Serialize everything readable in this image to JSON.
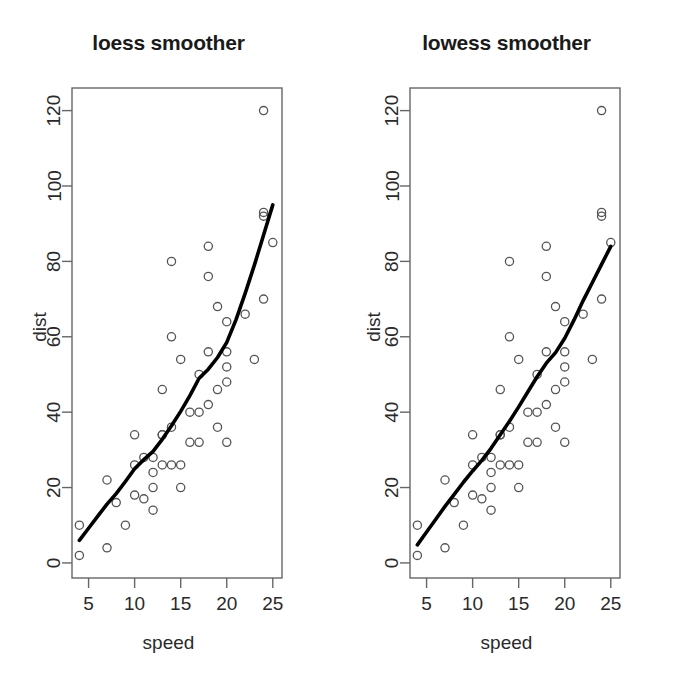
{
  "figure": {
    "background": "#ffffff",
    "point_color": "#555555",
    "line_color": "#000000",
    "axis_color": "#666666",
    "text_color": "#2a2a2a"
  },
  "panels": [
    {
      "id": "loess",
      "title": "loess smoother",
      "xlabel": "speed",
      "ylabel": "dist"
    },
    {
      "id": "lowess",
      "title": "lowess smoother",
      "xlabel": "speed",
      "ylabel": "dist"
    }
  ],
  "chart_data": [
    {
      "type": "scatter",
      "title": "loess smoother",
      "xlabel": "speed",
      "ylabel": "dist",
      "xlim": [
        3.2,
        26.0
      ],
      "ylim": [
        -4,
        126
      ],
      "xticks": [
        5,
        10,
        15,
        20,
        25
      ],
      "yticks": [
        0,
        20,
        40,
        60,
        80,
        100,
        120
      ],
      "grid": false,
      "legend": null,
      "x": [
        4,
        4,
        7,
        7,
        8,
        9,
        10,
        10,
        10,
        11,
        11,
        12,
        12,
        12,
        12,
        13,
        13,
        13,
        13,
        14,
        14,
        14,
        14,
        15,
        15,
        15,
        16,
        16,
        17,
        17,
        17,
        18,
        18,
        18,
        18,
        19,
        19,
        19,
        20,
        20,
        20,
        20,
        20,
        22,
        23,
        24,
        24,
        24,
        24,
        25
      ],
      "y": [
        2,
        10,
        4,
        22,
        16,
        10,
        18,
        26,
        34,
        17,
        28,
        14,
        20,
        24,
        28,
        26,
        34,
        34,
        46,
        26,
        36,
        60,
        80,
        20,
        26,
        54,
        32,
        40,
        32,
        40,
        50,
        42,
        56,
        76,
        84,
        36,
        46,
        68,
        32,
        48,
        52,
        56,
        64,
        66,
        54,
        70,
        92,
        93,
        120,
        85
      ],
      "series": [
        {
          "name": "loess smoother",
          "type": "line",
          "x": [
            4.0,
            5.0,
            6.0,
            7.0,
            8.0,
            9.0,
            10.0,
            11.0,
            12.0,
            13.0,
            14.0,
            15.0,
            16.0,
            17.0,
            18.0,
            19.0,
            20.0,
            21.0,
            22.0,
            23.0,
            24.0,
            25.0
          ],
          "y": [
            6.0,
            9.2,
            12.4,
            15.6,
            18.4,
            21.6,
            25.0,
            27.4,
            29.6,
            32.8,
            36.4,
            40.2,
            44.4,
            49.0,
            51.4,
            54.5,
            58.5,
            64.5,
            71.5,
            79.0,
            87.0,
            95.0
          ]
        }
      ]
    },
    {
      "type": "scatter",
      "title": "lowess smoother",
      "xlabel": "speed",
      "ylabel": "dist",
      "xlim": [
        3.2,
        26.0
      ],
      "ylim": [
        -4,
        126
      ],
      "xticks": [
        5,
        10,
        15,
        20,
        25
      ],
      "yticks": [
        0,
        20,
        40,
        60,
        80,
        100,
        120
      ],
      "grid": false,
      "legend": null,
      "x": [
        4,
        4,
        7,
        7,
        8,
        9,
        10,
        10,
        10,
        11,
        11,
        12,
        12,
        12,
        12,
        13,
        13,
        13,
        13,
        14,
        14,
        14,
        14,
        15,
        15,
        15,
        16,
        16,
        17,
        17,
        17,
        18,
        18,
        18,
        18,
        19,
        19,
        19,
        20,
        20,
        20,
        20,
        20,
        22,
        23,
        24,
        24,
        24,
        24,
        25
      ],
      "y": [
        2,
        10,
        4,
        22,
        16,
        10,
        18,
        26,
        34,
        17,
        28,
        14,
        20,
        24,
        28,
        26,
        34,
        34,
        46,
        26,
        36,
        60,
        80,
        20,
        26,
        54,
        32,
        40,
        32,
        40,
        50,
        42,
        56,
        76,
        84,
        36,
        46,
        68,
        32,
        48,
        52,
        56,
        64,
        66,
        54,
        70,
        92,
        93,
        120,
        85
      ],
      "series": [
        {
          "name": "lowess smoother",
          "type": "line",
          "x": [
            4.0,
            5.0,
            6.0,
            7.0,
            8.0,
            9.0,
            10.0,
            11.0,
            12.0,
            13.0,
            14.0,
            15.0,
            16.0,
            17.0,
            18.0,
            19.0,
            20.0,
            21.0,
            22.0,
            23.0,
            24.0,
            25.0
          ],
          "y": [
            4.8,
            8.2,
            11.6,
            15.0,
            18.2,
            21.4,
            24.4,
            27.2,
            30.4,
            34.0,
            37.6,
            41.4,
            45.4,
            49.4,
            53.0,
            55.8,
            59.6,
            64.4,
            69.6,
            74.4,
            79.2,
            84.0
          ]
        }
      ]
    }
  ]
}
